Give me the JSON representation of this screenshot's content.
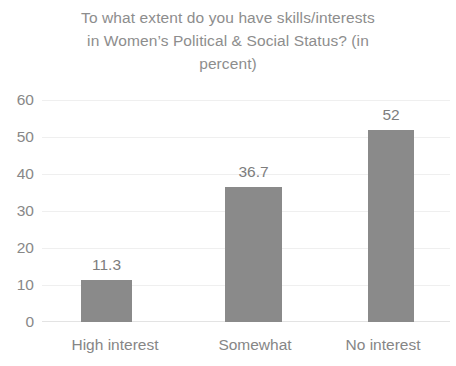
{
  "chart_data": {
    "type": "bar",
    "title": "To what extent do you have skills/interests in Women’s Political & Social Status? (in percent)",
    "title_lines": [
      "To what extent do you have skills/interests",
      "in Women’s Political & Social Status? (in",
      "percent)"
    ],
    "categories": [
      "High interest",
      "Somewhat",
      "No interest"
    ],
    "values": [
      11.3,
      36.7,
      52
    ],
    "value_labels": [
      "11.3",
      "36.7",
      "52"
    ],
    "xlabel": "",
    "ylabel": "",
    "ylim": [
      0,
      60
    ],
    "ytick_values": [
      60,
      50,
      40,
      30,
      20,
      10,
      0
    ],
    "ytick_labels": [
      "60",
      "50",
      "40",
      "30",
      "20",
      "10",
      "0"
    ],
    "grid": true,
    "grid_axis": "y",
    "legend": false,
    "legend_position": "none",
    "bar_color": "#8a8a8a",
    "gridline_color": "#efefef",
    "title_color": "#8d8d8d",
    "tick_label_color": "#888888",
    "value_label_color": "#7d7d7d",
    "background_color": "#ffffff"
  }
}
